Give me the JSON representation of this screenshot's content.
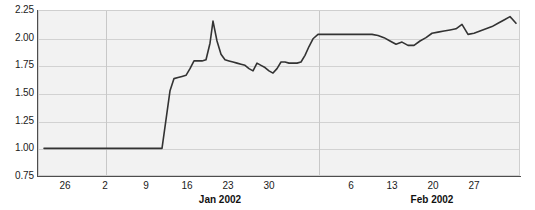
{
  "chart_data": {
    "type": "line",
    "title": "",
    "xlabel": "",
    "ylabel": "",
    "ylim": [
      0.75,
      2.25
    ],
    "yticks": [
      0.75,
      1.0,
      1.25,
      1.5,
      1.75,
      2.0,
      2.25
    ],
    "ytick_labels": [
      "0.75",
      "1.00",
      "1.25",
      "1.50",
      "1.75",
      "2.00",
      "2.25"
    ],
    "xtick_labels": [
      "26",
      "2",
      "9",
      "16",
      "23",
      "30",
      "6",
      "13",
      "20",
      "27"
    ],
    "xtick_positions": [
      65,
      105,
      146,
      187,
      228,
      269,
      351,
      392,
      433,
      474
    ],
    "month_labels": [
      {
        "label": "Jan 2002",
        "x": 220
      },
      {
        "label": "Feb 2002",
        "x": 432
      }
    ],
    "month_divider_positions": [
      105,
      318
    ],
    "grid": true,
    "legend": "none",
    "line_color": "#333333",
    "plot_background": "#f2f2f2",
    "gridline_color": "#d2d2d2",
    "axis_color": "#4d4d4d",
    "series": [
      {
        "name": "value",
        "x": [
          44,
          50,
          56,
          62,
          68,
          74,
          80,
          86,
          92,
          98,
          104,
          110,
          116,
          122,
          128,
          134,
          140,
          146,
          152,
          158,
          162,
          166,
          170,
          174,
          178,
          182,
          186,
          190,
          194,
          198,
          202,
          206,
          210,
          213,
          217,
          221,
          225,
          229,
          233,
          237,
          241,
          245,
          249,
          253,
          257,
          261,
          265,
          269,
          273,
          277,
          281,
          285,
          289,
          293,
          297,
          301,
          305,
          309,
          313,
          318,
          324,
          330,
          336,
          342,
          348,
          354,
          360,
          366,
          372,
          378,
          384,
          390,
          396,
          402,
          408,
          414,
          420,
          426,
          432,
          438,
          444,
          450,
          456,
          462,
          468,
          474,
          480,
          486,
          492,
          498,
          504,
          510,
          516
        ],
        "y": [
          1.0,
          1.0,
          1.0,
          1.0,
          1.0,
          1.0,
          1.0,
          1.0,
          1.0,
          1.0,
          1.0,
          1.0,
          1.0,
          1.0,
          1.0,
          1.0,
          1.0,
          1.0,
          1.0,
          1.0,
          1.0,
          1.26,
          1.52,
          1.63,
          1.64,
          1.65,
          1.66,
          1.72,
          1.79,
          1.79,
          1.79,
          1.8,
          1.95,
          2.15,
          1.97,
          1.85,
          1.8,
          1.79,
          1.78,
          1.77,
          1.76,
          1.75,
          1.72,
          1.7,
          1.77,
          1.75,
          1.73,
          1.7,
          1.68,
          1.72,
          1.78,
          1.78,
          1.77,
          1.77,
          1.77,
          1.78,
          1.84,
          1.92,
          1.99,
          2.03,
          2.03,
          2.03,
          2.03,
          2.03,
          2.03,
          2.03,
          2.03,
          2.03,
          2.03,
          2.02,
          2.0,
          1.97,
          1.94,
          1.96,
          1.93,
          1.93,
          1.97,
          2.0,
          2.04,
          2.05,
          2.06,
          2.07,
          2.08,
          2.12,
          2.03,
          2.04,
          2.06,
          2.08,
          2.1,
          2.13,
          2.16,
          2.19,
          2.13
        ]
      }
    ]
  }
}
